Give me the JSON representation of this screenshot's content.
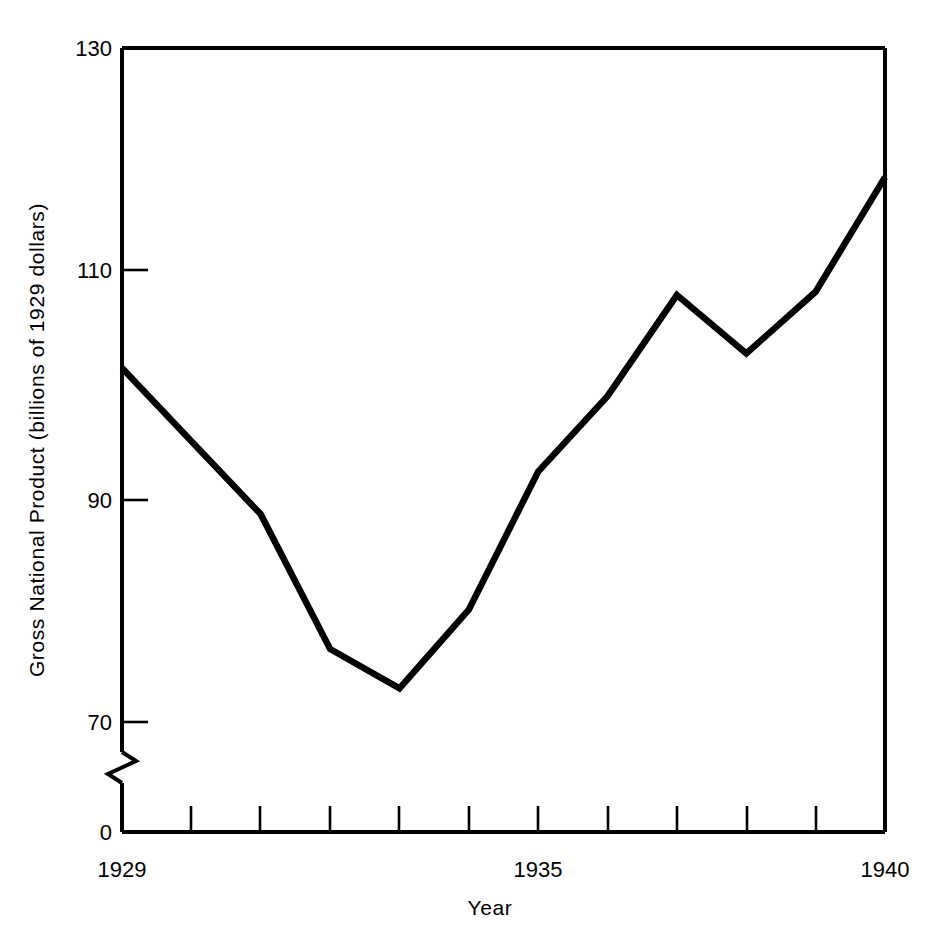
{
  "chart_data": {
    "type": "line",
    "title": "",
    "xlabel": "Year",
    "ylabel": "Gross National Product (billions of 1929 dollars)",
    "x": [
      1929,
      1930,
      1931,
      1932,
      1933,
      1934,
      1935,
      1936,
      1937,
      1938,
      1939,
      1940
    ],
    "values": [
      101.5,
      95.0,
      88.5,
      76.5,
      73.0,
      80.0,
      92.3,
      99.0,
      108.0,
      102.8,
      108.3,
      118.5
    ],
    "series": [
      {
        "name": "Gross National Product",
        "values": [
          101.5,
          95.0,
          88.5,
          76.5,
          73.0,
          80.0,
          92.3,
          99.0,
          108.0,
          102.8,
          108.3,
          118.5
        ]
      }
    ],
    "xlim": [
      1929,
      1940
    ],
    "ylim": [
      0,
      130
    ],
    "y_axis_break": true,
    "y_break_range": [
      0,
      66
    ],
    "grid": false,
    "legend": false,
    "legend_position": "none",
    "line_color": "#000000",
    "background_color": "#ffffff",
    "y_ticks": [
      {
        "value": 0,
        "label": "0"
      },
      {
        "value": 70,
        "label": "70"
      },
      {
        "value": 90,
        "label": "90"
      },
      {
        "value": 110,
        "label": "110"
      },
      {
        "value": 130,
        "label": "130"
      }
    ],
    "x_ticks": [
      {
        "value": 1929,
        "label": "1929"
      },
      {
        "value": 1930,
        "label": ""
      },
      {
        "value": 1931,
        "label": ""
      },
      {
        "value": 1932,
        "label": ""
      },
      {
        "value": 1933,
        "label": ""
      },
      {
        "value": 1934,
        "label": ""
      },
      {
        "value": 1935,
        "label": "1935"
      },
      {
        "value": 1936,
        "label": ""
      },
      {
        "value": 1937,
        "label": ""
      },
      {
        "value": 1938,
        "label": ""
      },
      {
        "value": 1939,
        "label": ""
      },
      {
        "value": 1940,
        "label": "1940"
      }
    ]
  },
  "axes": {
    "y_label_text": "Gross National Product (billions of 1929 dollars)",
    "x_label_text": "Year",
    "y_tick_130": "130",
    "y_tick_110": "110",
    "y_tick_90": "90",
    "y_tick_70": "70",
    "y_tick_0": "0",
    "x_tick_start": "1929",
    "x_tick_mid": "1935",
    "x_tick_end": "1940"
  }
}
